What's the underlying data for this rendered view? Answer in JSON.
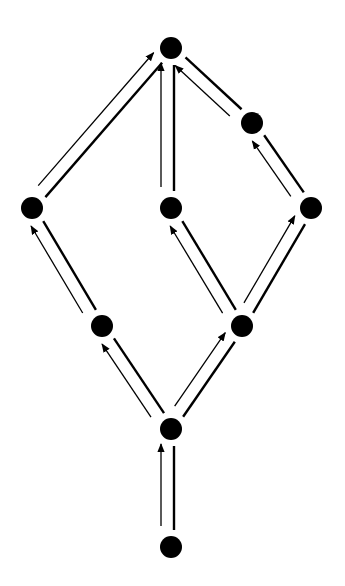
{
  "diagram": {
    "title": "",
    "type": "hasse-diagram-with-arrows",
    "colors": {
      "background": "#ffffff",
      "ink": "#000000"
    },
    "nodes": [
      {
        "id": "top",
        "x": 171,
        "y": 48
      },
      {
        "id": "upper-right",
        "x": 252,
        "y": 123
      },
      {
        "id": "left",
        "x": 32,
        "y": 208
      },
      {
        "id": "center",
        "x": 171,
        "y": 208
      },
      {
        "id": "right",
        "x": 311,
        "y": 208
      },
      {
        "id": "lower-left",
        "x": 102,
        "y": 326
      },
      {
        "id": "lower-right",
        "x": 242,
        "y": 326
      },
      {
        "id": "bottom-mid",
        "x": 171,
        "y": 429
      },
      {
        "id": "bottom",
        "x": 171,
        "y": 547
      }
    ],
    "edges": [
      {
        "from": "bottom",
        "to": "bottom-mid"
      },
      {
        "from": "bottom-mid",
        "to": "lower-left"
      },
      {
        "from": "bottom-mid",
        "to": "lower-right"
      },
      {
        "from": "lower-left",
        "to": "left"
      },
      {
        "from": "lower-right",
        "to": "center"
      },
      {
        "from": "lower-right",
        "to": "right"
      },
      {
        "from": "left",
        "to": "top"
      },
      {
        "from": "center",
        "to": "top"
      },
      {
        "from": "right",
        "to": "upper-right"
      },
      {
        "from": "upper-right",
        "to": "top"
      }
    ]
  }
}
